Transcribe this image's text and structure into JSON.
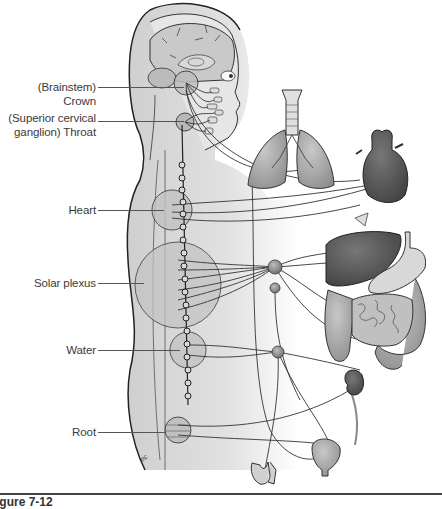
{
  "figure": {
    "caption": "igure 7-12",
    "signature": "ec",
    "colors": {
      "body_fill": "#dcdcdc",
      "outline": "#2a2a2a",
      "plexus_fill": "#c4c4c4",
      "organ_dark": "#5a5a5a",
      "organ_mid": "#9a9a9a",
      "nerve": "#333333"
    }
  },
  "labels": [
    {
      "id": "crown",
      "text": "(Brainstem) Crown"
    },
    {
      "id": "throat",
      "line1": "(Superior cervical",
      "line2": "ganglion) Throat"
    },
    {
      "id": "heart",
      "text": "Heart"
    },
    {
      "id": "solar_plexus",
      "text": "Solar plexus"
    },
    {
      "id": "water",
      "text": "Water"
    },
    {
      "id": "root",
      "text": "Root"
    }
  ],
  "organs": [
    "brain",
    "eye",
    "face glands",
    "trachea",
    "lungs",
    "heart",
    "liver",
    "stomach",
    "intestines",
    "kidney",
    "bladder",
    "genitals"
  ]
}
